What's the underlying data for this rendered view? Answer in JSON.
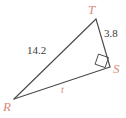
{
  "figure": {
    "type": "geometry-diagram",
    "shape": "right-triangle",
    "background_color": "#ffffff",
    "stroke_color": "#4a4a4a",
    "vertex_label_color": "#d98a7a",
    "measure_label_color": "#3a3a3a",
    "vertices": [
      {
        "name": "T",
        "label": "T",
        "x": 96,
        "y": 19
      },
      {
        "name": "S",
        "label": "S",
        "x": 110,
        "y": 67
      },
      {
        "name": "R",
        "label": "R",
        "x": 14,
        "y": 99
      }
    ],
    "sides": [
      {
        "name": "RT",
        "label": "14.2",
        "kind": "measure",
        "from": "R",
        "to": "T"
      },
      {
        "name": "TS",
        "label": "3.8",
        "kind": "measure",
        "from": "T",
        "to": "S"
      },
      {
        "name": "RS",
        "label": "t",
        "kind": "variable",
        "from": "R",
        "to": "S"
      }
    ],
    "markers": [
      {
        "name": "right-angle-marker",
        "at_vertex": "S",
        "symbol": "square"
      }
    ]
  }
}
